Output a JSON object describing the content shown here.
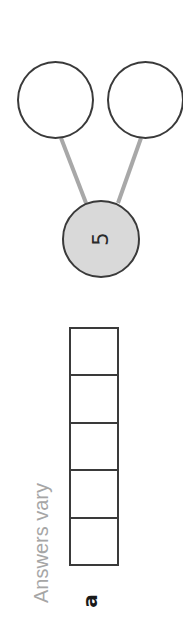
{
  "diagram": {
    "orientation": "rotated-90-ccw",
    "part_label": "a",
    "answer_note": "Answers vary",
    "number_bond": {
      "whole": {
        "value": "5",
        "fill": "#d9d9d9"
      },
      "parts": [
        {
          "value": ""
        },
        {
          "value": ""
        }
      ],
      "connector_color": "#a8a8a8",
      "outline_color": "#3a3a3a"
    },
    "frame": {
      "cells": 5,
      "filled": [
        false,
        false,
        false,
        false,
        false
      ]
    }
  }
}
